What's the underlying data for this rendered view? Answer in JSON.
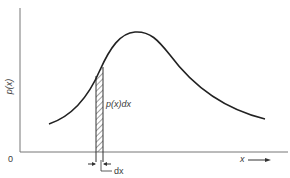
{
  "diagram": {
    "y_axis_label": "p(x)",
    "origin_label": "0",
    "x_axis_label": "x",
    "strip_label": "p(x)dx",
    "width_label": "dx",
    "colors": {
      "curve": "#222222",
      "axis": "#777777",
      "hatch": "#444444",
      "text": "#3a3a3a"
    }
  }
}
